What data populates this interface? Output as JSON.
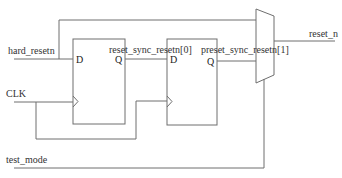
{
  "diagram": {
    "type": "reset-synchronizer-schematic",
    "signals": {
      "hard_resetn": "hard_resetn",
      "clk": "CLK",
      "test_mode": "test_mode",
      "reset_sync_0": "reset_sync_resetn[0]",
      "reset_sync_1": "preset_sync_resetn[1]",
      "reset_n": "reset_n"
    },
    "flipflops": [
      {
        "id": "ff1",
        "d_label": "D",
        "q_label": "Q"
      },
      {
        "id": "ff2",
        "d_label": "D",
        "q_label": "Q"
      }
    ],
    "mux": {
      "id": "mux",
      "select_signal": "test_mode"
    },
    "colors": {
      "line": "#6e6e6e",
      "text": "#333333",
      "background": "#ffffff"
    }
  }
}
